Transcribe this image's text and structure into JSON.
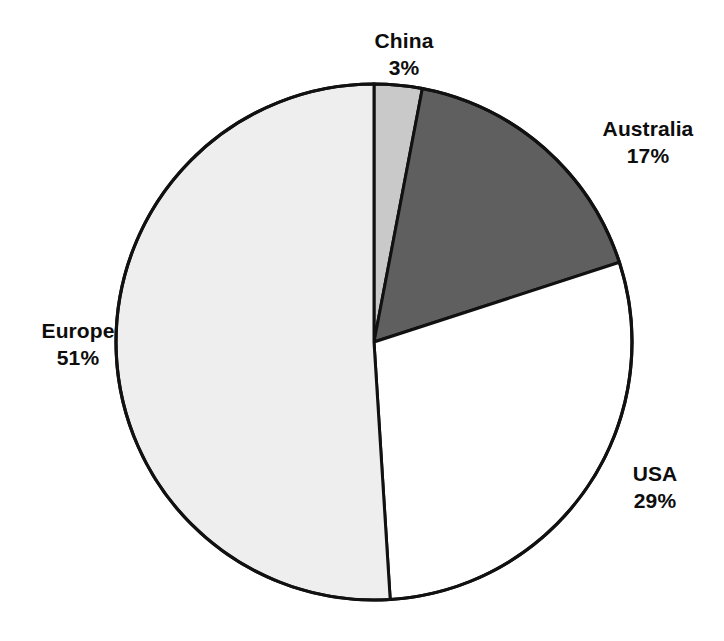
{
  "chart_data": {
    "type": "pie",
    "title": "",
    "subtitle": "",
    "xlabel": "",
    "ylabel": "",
    "legend_position": "none",
    "grid": false,
    "labels_inline": true,
    "units": "percent",
    "total": 100,
    "start_angle_deg": 0,
    "direction": "clockwise",
    "categories": [
      "China",
      "Australia",
      "USA",
      "Europe"
    ],
    "values": [
      3,
      17,
      29,
      51
    ],
    "slices": [
      {
        "label": "China",
        "value": 3,
        "value_text": "3%",
        "color": "#c9c9c9",
        "start_deg": 0,
        "end_deg": 10.8,
        "label_x": 404,
        "label_y": 27
      },
      {
        "label": "Australia",
        "value": 17,
        "value_text": "17%",
        "color": "#5f5f5f",
        "start_deg": 10.8,
        "end_deg": 72.0,
        "label_x": 648,
        "label_y": 115
      },
      {
        "label": "USA",
        "value": 29,
        "value_text": "29%",
        "color": "#ffffff",
        "start_deg": 72.0,
        "end_deg": 176.4,
        "label_x": 655,
        "label_y": 460
      },
      {
        "label": "Europe",
        "value": 51,
        "value_text": "51%",
        "color": "#eeeeee",
        "start_deg": 176.4,
        "end_deg": 360.0,
        "label_x": 78,
        "label_y": 317
      }
    ],
    "geometry": {
      "center_x": 374,
      "center_y": 342,
      "radius": 258
    },
    "style": {
      "background": "#ffffff",
      "outline_color": "#111111",
      "outline_width": 3,
      "text_color": "#0d0d0d"
    }
  }
}
